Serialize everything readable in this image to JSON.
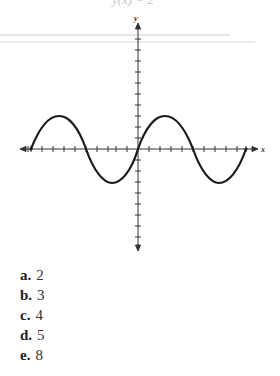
{
  "question": {
    "top_fragment": "y(x) = 2"
  },
  "graph": {
    "x_axis_label": "x",
    "y_axis_label": "y",
    "curve": "sine",
    "tick_spacing_px": 11
  },
  "choices": [
    {
      "letter": "a.",
      "value": "2"
    },
    {
      "letter": "b.",
      "value": "3"
    },
    {
      "letter": "c.",
      "value": "4"
    },
    {
      "letter": "d.",
      "value": "5"
    },
    {
      "letter": "e.",
      "value": "8"
    }
  ]
}
